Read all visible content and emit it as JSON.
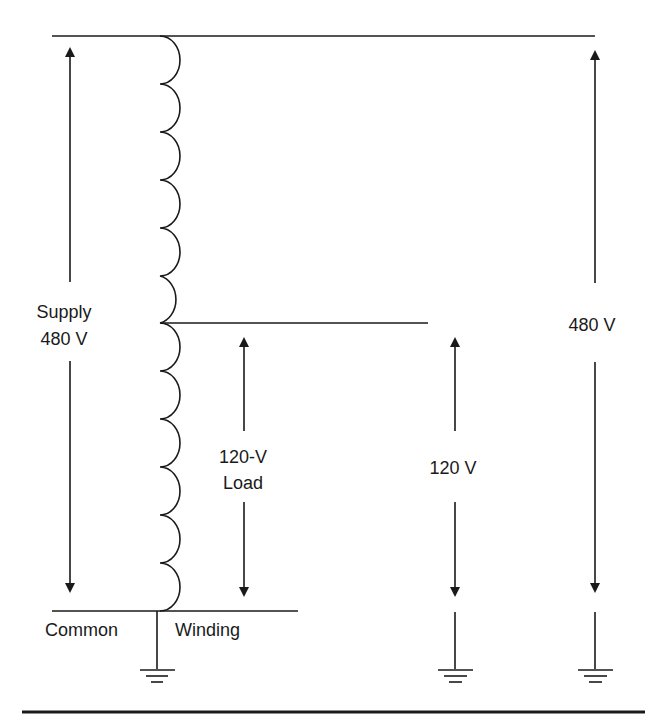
{
  "diagram": {
    "type": "autotransformer-schematic",
    "labels": {
      "supply_line1": "Supply",
      "supply_line2": "480 V",
      "load_line1": "120-V",
      "load_line2": "Load",
      "secondary_voltage": "120 V",
      "primary_voltage": "480 V",
      "common": "Common",
      "winding": "Winding"
    },
    "coil": {
      "turns_above_tap": 6,
      "turns_below_tap": 6
    },
    "grounds": 3,
    "colors": {
      "line": "#1a1a1a",
      "background": "#ffffff"
    }
  }
}
